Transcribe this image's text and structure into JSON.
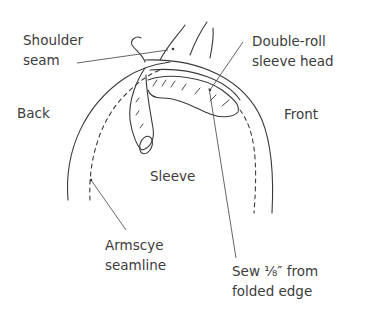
{
  "diagram": {
    "labels": {
      "shoulder_seam": [
        "Shoulder",
        "seam"
      ],
      "double_roll": [
        "Double-roll",
        "sleeve head"
      ],
      "back": "Back",
      "front": "Front",
      "sleeve": "Sleeve",
      "armscye": [
        "Armscye",
        "seamline"
      ],
      "sew_note": [
        "Sew ⅛″ from",
        "folded edge"
      ]
    },
    "colors": {
      "ink": "#3a3a3a",
      "text": "#3c3c3c",
      "background": "#ffffff"
    }
  }
}
